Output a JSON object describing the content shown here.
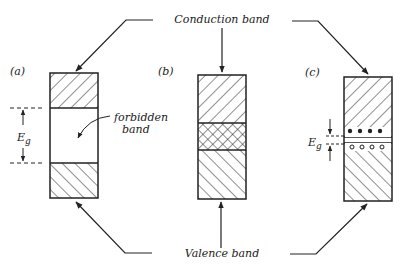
{
  "labels": {
    "conduction_band": "Conduction band",
    "valence_band": "Valence band",
    "forbidden_band_line1": "forbidden",
    "forbidden_band_line2": "band",
    "energy_gap": "E",
    "energy_gap_sub": "g"
  },
  "panels": [
    {
      "id": "a",
      "label": "(a)",
      "description": "Insulator: wide forbidden band between conduction and valence bands"
    },
    {
      "id": "b",
      "label": "(b)",
      "description": "Conductor: overlapping conduction and valence bands"
    },
    {
      "id": "c",
      "label": "(c)",
      "description": "Semiconductor: narrow energy gap with electrons and holes"
    }
  ],
  "colors": {
    "ink": "#222222",
    "background": "#ffffff"
  }
}
